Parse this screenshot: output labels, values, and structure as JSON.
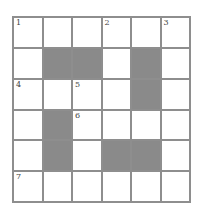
{
  "puzzle": {
    "rows": 6,
    "cols": 6,
    "colors": {
      "grid_line": "#8e8e8e",
      "block": "#8a8a8a",
      "cell": "#ffffff"
    },
    "cells": [
      [
        {
          "n": "1"
        },
        {},
        {},
        {
          "n": "2"
        },
        {},
        {
          "n": "3"
        }
      ],
      [
        {},
        {
          "b": true
        },
        {
          "b": true
        },
        {},
        {
          "b": true
        },
        {}
      ],
      [
        {
          "n": "4"
        },
        {},
        {
          "n": "5"
        },
        {},
        {
          "b": true
        },
        {}
      ],
      [
        {},
        {
          "b": true
        },
        {
          "n": "6"
        },
        {},
        {},
        {}
      ],
      [
        {},
        {
          "b": true
        },
        {},
        {
          "b": true
        },
        {
          "b": true
        },
        {}
      ],
      [
        {
          "n": "7"
        },
        {},
        {},
        {},
        {},
        {}
      ]
    ]
  }
}
